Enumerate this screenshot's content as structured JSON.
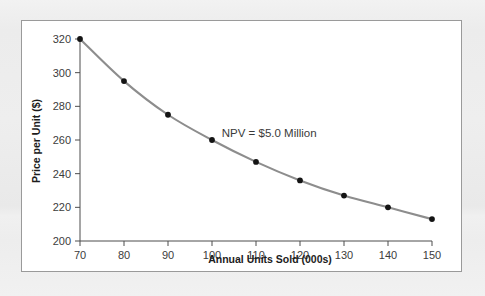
{
  "figure": {
    "frame_border_color": "#9a9a9a",
    "background_color": "#eeeeee",
    "plot_background_color": "#ffffff"
  },
  "chart_data": {
    "type": "line",
    "title": "",
    "subtitle": "",
    "xlabel": "Annual Units Sold (000s)",
    "ylabel": "Price per Unit ($)",
    "xlim": [
      70,
      150
    ],
    "ylim": [
      200,
      320
    ],
    "xticks": [
      70,
      80,
      90,
      100,
      110,
      120,
      130,
      140,
      150
    ],
    "xtick_labels": [
      "70",
      "80",
      "90",
      "100",
      "110",
      "120",
      "130",
      "140",
      "150"
    ],
    "yticks": [
      200,
      220,
      240,
      260,
      280,
      300,
      320
    ],
    "ytick_labels": [
      "200",
      "220",
      "240",
      "260",
      "280",
      "300",
      "320"
    ],
    "grid": false,
    "legend": false,
    "legend_position": "none",
    "line_color": "#8d8d8d",
    "marker_color": "#141414",
    "x": [
      70,
      80,
      90,
      100,
      110,
      120,
      130,
      140,
      150
    ],
    "values": [
      320,
      295,
      275,
      260,
      247,
      236,
      227,
      220,
      213
    ],
    "series": [
      {
        "name": "NPV = $5.0 Million isoquant",
        "x": [
          70,
          80,
          90,
          100,
          110,
          120,
          130,
          140,
          150
        ],
        "values": [
          320,
          295,
          275,
          260,
          247,
          236,
          227,
          220,
          213
        ]
      }
    ],
    "annotations": [
      {
        "text": "NPV = $5.0 Million",
        "x": 113,
        "y": 262
      }
    ]
  }
}
